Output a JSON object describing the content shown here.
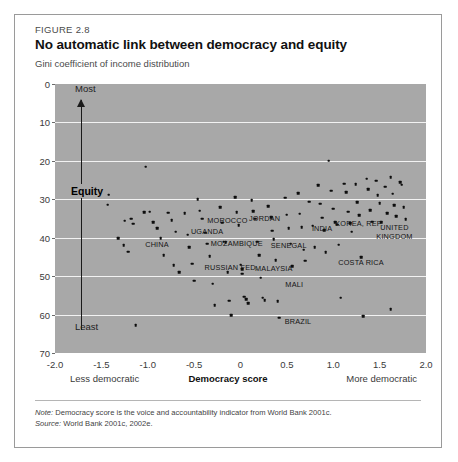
{
  "figure": {
    "number": "FIGURE 2.8",
    "title": "No automatic link between democracy and equity",
    "subtitle": "Gini coefficient of income distribution"
  },
  "annotations": {
    "most": "Most",
    "least": "Least",
    "equity": "Equity",
    "axis_left_caption": "Less democratic",
    "axis_right_caption": "More democratic"
  },
  "notes": {
    "note_label": "Note:",
    "note_text": "Democracy score is the voice and accountability indicator from World Bank 2001c.",
    "source_label": "Source:",
    "source_text": "World Bank 2001c, 2002e."
  },
  "colors": {
    "plot_background": "#a8a8a8",
    "gridline": "#f2f2f2",
    "point": "#0d0d0d",
    "border": "#9a9a9a",
    "page": "#ffffff"
  },
  "chart_data": {
    "type": "scatter",
    "title": "No automatic link between democracy and equity",
    "subtitle": "Gini coefficient of income distribution",
    "xlabel": "Democracy score",
    "ylabel": "Gini coefficient of income distribution",
    "xlim": [
      -2.0,
      2.0
    ],
    "ylim": [
      0,
      70
    ],
    "y_inverted": true,
    "grid": "horizontal",
    "legend": "none",
    "xticks": [
      "-2.0",
      "-1.5",
      "-1.0",
      "-0.5",
      "0",
      "0.5",
      "1.0",
      "1.5",
      "2.0"
    ],
    "xtick_values": [
      -2.0,
      -1.5,
      -1.0,
      -0.5,
      0,
      0.5,
      1.0,
      1.5,
      2.0
    ],
    "yticks": [
      "0",
      "10",
      "20",
      "30",
      "40",
      "50",
      "60",
      "70"
    ],
    "ytick_values": [
      0,
      10,
      20,
      30,
      40,
      50,
      60,
      70
    ],
    "points": [
      {
        "x": -1.42,
        "y": 28.8
      },
      {
        "x": -1.43,
        "y": 31.4
      },
      {
        "x": -1.25,
        "y": 35.6
      },
      {
        "x": -1.18,
        "y": 35.1
      },
      {
        "x": -1.16,
        "y": 36.4
      },
      {
        "x": -1.32,
        "y": 40.2
      },
      {
        "x": -1.26,
        "y": 42.0
      },
      {
        "x": -1.21,
        "y": 43.6
      },
      {
        "x": -1.13,
        "y": 62.8
      },
      {
        "x": -1.02,
        "y": 21.5
      },
      {
        "x": -1.04,
        "y": 33.3
      },
      {
        "x": -0.98,
        "y": 33.2
      },
      {
        "x": -0.94,
        "y": 36.0
      },
      {
        "x": -0.9,
        "y": 37.5
      },
      {
        "x": -0.86,
        "y": 40.1
      },
      {
        "x": -0.83,
        "y": 44.5
      },
      {
        "x": -0.78,
        "y": 33.5
      },
      {
        "x": -0.74,
        "y": 35.4
      },
      {
        "x": -0.7,
        "y": 38.4
      },
      {
        "x": -0.72,
        "y": 47.2
      },
      {
        "x": -0.66,
        "y": 49.0
      },
      {
        "x": -0.6,
        "y": 33.6
      },
      {
        "x": -0.57,
        "y": 39.2
      },
      {
        "x": -0.55,
        "y": 42.4
      },
      {
        "x": -0.52,
        "y": 46.8
      },
      {
        "x": -0.5,
        "y": 51.2
      },
      {
        "x": -0.46,
        "y": 30.0
      },
      {
        "x": -0.44,
        "y": 33.0
      },
      {
        "x": -0.41,
        "y": 35.1
      },
      {
        "x": -0.38,
        "y": 38.7
      },
      {
        "x": -0.36,
        "y": 41.6
      },
      {
        "x": -0.33,
        "y": 44.8
      },
      {
        "x": -0.3,
        "y": 52.0
      },
      {
        "x": -0.28,
        "y": 57.5
      },
      {
        "x": -0.22,
        "y": 32.0
      },
      {
        "x": -0.2,
        "y": 36.1
      },
      {
        "x": -0.18,
        "y": 41.0
      },
      {
        "x": -0.16,
        "y": 41.2
      },
      {
        "x": -0.14,
        "y": 48.9
      },
      {
        "x": -0.12,
        "y": 56.4
      },
      {
        "x": -0.1,
        "y": 60.2
      },
      {
        "x": -0.06,
        "y": 29.5
      },
      {
        "x": -0.04,
        "y": 33.4
      },
      {
        "x": -0.02,
        "y": 36.8
      },
      {
        "x": 0.0,
        "y": 47.0
      },
      {
        "x": 0.02,
        "y": 48.2
      },
      {
        "x": 0.02,
        "y": 49.4
      },
      {
        "x": 0.04,
        "y": 55.3
      },
      {
        "x": 0.06,
        "y": 56.0
      },
      {
        "x": 0.08,
        "y": 57.1
      },
      {
        "x": 0.12,
        "y": 30.2
      },
      {
        "x": 0.14,
        "y": 33.1
      },
      {
        "x": 0.16,
        "y": 35.0
      },
      {
        "x": 0.18,
        "y": 41.0
      },
      {
        "x": 0.2,
        "y": 44.6
      },
      {
        "x": 0.22,
        "y": 50.4
      },
      {
        "x": 0.24,
        "y": 55.6
      },
      {
        "x": 0.26,
        "y": 56.2
      },
      {
        "x": 0.3,
        "y": 31.8
      },
      {
        "x": 0.33,
        "y": 34.7
      },
      {
        "x": 0.34,
        "y": 38.2
      },
      {
        "x": 0.36,
        "y": 40.4
      },
      {
        "x": 0.38,
        "y": 45.8
      },
      {
        "x": 0.4,
        "y": 56.5
      },
      {
        "x": 0.42,
        "y": 60.8
      },
      {
        "x": 0.48,
        "y": 29.6
      },
      {
        "x": 0.5,
        "y": 34.0
      },
      {
        "x": 0.52,
        "y": 37.6
      },
      {
        "x": 0.54,
        "y": 41.6
      },
      {
        "x": 0.56,
        "y": 47.4
      },
      {
        "x": 0.62,
        "y": 28.4
      },
      {
        "x": 0.64,
        "y": 33.8
      },
      {
        "x": 0.66,
        "y": 37.2
      },
      {
        "x": 0.68,
        "y": 43.1
      },
      {
        "x": 0.7,
        "y": 46.0
      },
      {
        "x": 0.74,
        "y": 30.6
      },
      {
        "x": 0.78,
        "y": 36.9
      },
      {
        "x": 0.8,
        "y": 42.5
      },
      {
        "x": 0.84,
        "y": 26.4
      },
      {
        "x": 0.86,
        "y": 31.2
      },
      {
        "x": 0.88,
        "y": 34.8
      },
      {
        "x": 0.9,
        "y": 38.0
      },
      {
        "x": 0.92,
        "y": 43.7
      },
      {
        "x": 0.95,
        "y": 20.0
      },
      {
        "x": 0.98,
        "y": 27.8
      },
      {
        "x": 1.0,
        "y": 32.4
      },
      {
        "x": 1.02,
        "y": 35.9
      },
      {
        "x": 1.04,
        "y": 36.6
      },
      {
        "x": 1.06,
        "y": 41.8
      },
      {
        "x": 1.08,
        "y": 55.6
      },
      {
        "x": 1.12,
        "y": 25.9
      },
      {
        "x": 1.14,
        "y": 28.2
      },
      {
        "x": 1.16,
        "y": 33.2
      },
      {
        "x": 1.18,
        "y": 36.2
      },
      {
        "x": 1.2,
        "y": 38.4
      },
      {
        "x": 1.24,
        "y": 26.1
      },
      {
        "x": 1.26,
        "y": 30.8
      },
      {
        "x": 1.28,
        "y": 34.2
      },
      {
        "x": 1.3,
        "y": 45.0
      },
      {
        "x": 1.32,
        "y": 60.4
      },
      {
        "x": 1.36,
        "y": 24.6
      },
      {
        "x": 1.38,
        "y": 27.4
      },
      {
        "x": 1.4,
        "y": 32.9
      },
      {
        "x": 1.42,
        "y": 35.8
      },
      {
        "x": 1.46,
        "y": 25.2
      },
      {
        "x": 1.48,
        "y": 29.0
      },
      {
        "x": 1.5,
        "y": 31.0
      },
      {
        "x": 1.52,
        "y": 36.0
      },
      {
        "x": 1.56,
        "y": 26.7
      },
      {
        "x": 1.58,
        "y": 33.6
      },
      {
        "x": 1.62,
        "y": 24.2
      },
      {
        "x": 1.64,
        "y": 28.6
      },
      {
        "x": 1.66,
        "y": 31.5
      },
      {
        "x": 1.68,
        "y": 34.4
      },
      {
        "x": 1.72,
        "y": 25.5
      },
      {
        "x": 1.74,
        "y": 26.2
      },
      {
        "x": 1.76,
        "y": 32.0
      },
      {
        "x": 1.78,
        "y": 35.2
      },
      {
        "x": 1.62,
        "y": 58.6
      }
    ],
    "labeled_countries": [
      {
        "name": "CHINA",
        "x": -0.9,
        "y": 41.7
      },
      {
        "name": "UGANDA",
        "x": -0.36,
        "y": 38.3
      },
      {
        "name": "MOROCCO",
        "x": -0.14,
        "y": 35.3
      },
      {
        "name": "MOZAMBIQUE",
        "x": -0.04,
        "y": 41.3
      },
      {
        "name": "RUSSIAN FED.",
        "x": -0.1,
        "y": 47.6
      },
      {
        "name": "JORDAN",
        "x": 0.26,
        "y": 34.9
      },
      {
        "name": "MALAYSIA",
        "x": 0.36,
        "y": 47.9
      },
      {
        "name": "SENEGAL",
        "x": 0.52,
        "y": 42.0
      },
      {
        "name": "MALI",
        "x": 0.58,
        "y": 52.0
      },
      {
        "name": "BRAZIL",
        "x": 0.62,
        "y": 61.8
      },
      {
        "name": "INDIA",
        "x": 0.88,
        "y": 37.6
      },
      {
        "name": "KOREA, REP.",
        "x": 1.28,
        "y": 36.2
      },
      {
        "name": "COSTA RICA",
        "x": 1.3,
        "y": 46.4
      },
      {
        "name": "UNITED KINGDOM",
        "x": 1.66,
        "y": 38.9,
        "lines": [
          "UNITED",
          "KINGDOM"
        ]
      }
    ]
  }
}
